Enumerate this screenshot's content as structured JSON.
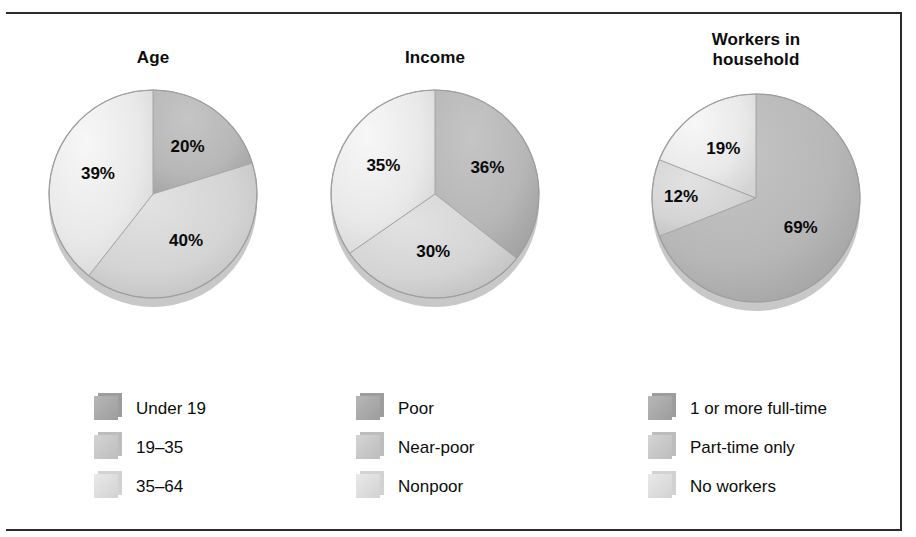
{
  "figure": {
    "background": "#ffffff",
    "rule_color": "#2b2b2b"
  },
  "palette": {
    "dark": "#b7b7b7",
    "mid": "#d4d4d4",
    "light": "#e9e9e9",
    "dark_shadow": "#9d9d9d",
    "mid_shadow": "#bdbdbd",
    "light_shadow": "#d2d2d2",
    "edge": "#a8a8a8"
  },
  "chart_data": [
    {
      "type": "pie",
      "title": "Age",
      "id": "age",
      "categories": [
        "Under 19",
        "19–35",
        "35–64"
      ],
      "values": [
        20,
        40,
        39
      ],
      "labels": [
        "20%",
        "40%",
        "39%"
      ],
      "colors": [
        "#b7b7b7",
        "#d4d4d4",
        "#e9e9e9"
      ],
      "start_angle": 0,
      "direction": "clockwise",
      "legend_position": "bottom"
    },
    {
      "type": "pie",
      "title": "Income",
      "id": "income",
      "categories": [
        "Poor",
        "Near-poor",
        "Nonpoor"
      ],
      "values": [
        36,
        30,
        35
      ],
      "labels": [
        "36%",
        "30%",
        "35%"
      ],
      "colors": [
        "#b7b7b7",
        "#d4d4d4",
        "#e9e9e9"
      ],
      "start_angle": 0,
      "direction": "clockwise",
      "legend_position": "bottom"
    },
    {
      "type": "pie",
      "title": "Workers in\nhousehold",
      "id": "workers",
      "categories": [
        "1 or more full-time",
        "Part-time only",
        "No workers"
      ],
      "values": [
        69,
        12,
        19
      ],
      "labels": [
        "69%",
        "12%",
        "19%"
      ],
      "colors": [
        "#b7b7b7",
        "#d4d4d4",
        "#e9e9e9"
      ],
      "start_angle": 0,
      "direction": "clockwise",
      "legend_position": "bottom"
    }
  ]
}
